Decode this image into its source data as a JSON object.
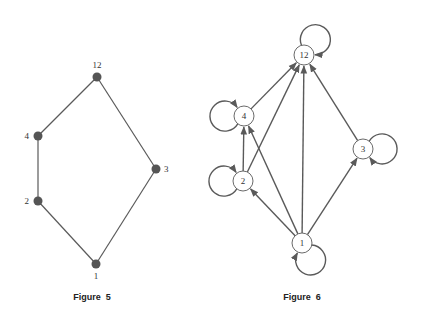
{
  "colors": {
    "edge": "#5a5a5a",
    "node_fill_hasse": "#555555",
    "node_fill_graph": "#ffffff",
    "node_stroke": "#6a6a6a",
    "text": "#333333"
  },
  "figure5": {
    "caption": "Figure  5",
    "type": "hasse-diagram",
    "nodes": [
      {
        "id": "12",
        "label": "12",
        "x": 97,
        "y": 77,
        "label_dx": 0,
        "label_dy": -9,
        "anchor": "middle"
      },
      {
        "id": "4",
        "label": "4",
        "x": 38,
        "y": 136,
        "label_dx": -9,
        "label_dy": 3,
        "anchor": "end"
      },
      {
        "id": "3",
        "label": "3",
        "x": 156,
        "y": 169,
        "label_dx": 8,
        "label_dy": 3,
        "anchor": "start"
      },
      {
        "id": "2",
        "label": "2",
        "x": 38,
        "y": 201,
        "label_dx": -9,
        "label_dy": 3,
        "anchor": "end"
      },
      {
        "id": "1",
        "label": "1",
        "x": 96,
        "y": 264,
        "label_dx": 0,
        "label_dy": 15,
        "anchor": "middle"
      }
    ],
    "edges": [
      {
        "from": "1",
        "to": "2"
      },
      {
        "from": "2",
        "to": "4"
      },
      {
        "from": "4",
        "to": "12"
      },
      {
        "from": "1",
        "to": "3"
      },
      {
        "from": "3",
        "to": "12"
      }
    ]
  },
  "figure6": {
    "caption": "Figure  6",
    "type": "directed-graph",
    "node_radius": 10,
    "nodes": [
      {
        "id": "12",
        "label": "12",
        "x": 304,
        "y": 55
      },
      {
        "id": "4",
        "label": "4",
        "x": 244,
        "y": 116
      },
      {
        "id": "3",
        "label": "3",
        "x": 363,
        "y": 149
      },
      {
        "id": "2",
        "label": "2",
        "x": 243,
        "y": 181
      },
      {
        "id": "1",
        "label": "1",
        "x": 302,
        "y": 243
      }
    ],
    "edges": [
      {
        "from": "1",
        "to": "2"
      },
      {
        "from": "1",
        "to": "4"
      },
      {
        "from": "1",
        "to": "12"
      },
      {
        "from": "1",
        "to": "3"
      },
      {
        "from": "2",
        "to": "4"
      },
      {
        "from": "2",
        "to": "12"
      },
      {
        "from": "4",
        "to": "12"
      },
      {
        "from": "3",
        "to": "12"
      }
    ],
    "loops": [
      {
        "node": "12",
        "direction": "up-right"
      },
      {
        "node": "4",
        "direction": "left"
      },
      {
        "node": "2",
        "direction": "left"
      },
      {
        "node": "3",
        "direction": "right"
      },
      {
        "node": "1",
        "direction": "down-right"
      }
    ]
  }
}
